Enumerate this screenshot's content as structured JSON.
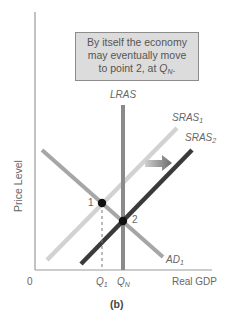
{
  "callout": {
    "line1": "By itself the economy",
    "line2": "may eventually move",
    "line3_prefix": "to point 2, at ",
    "line3_q": "Q",
    "line3_sub": "N",
    "line3_suffix": "."
  },
  "axes": {
    "y_label": "Price Level",
    "x_label": "Real GDP",
    "origin": "0"
  },
  "curves": {
    "lras": {
      "label": "LRAS",
      "color": "#8a8a8a"
    },
    "sras1": {
      "label": "SRAS",
      "sub": "1",
      "color": "#d2d2d2"
    },
    "sras2": {
      "label": "SRAS",
      "sub": "2",
      "color": "#3a3a3a"
    },
    "ad1": {
      "label": "AD",
      "sub": "1",
      "color": "#a6a6a6"
    }
  },
  "points": {
    "p1": "1",
    "p2": "2"
  },
  "ticks": {
    "q1": "Q",
    "q1_sub": "1",
    "qn": "Q",
    "qn_sub": "N"
  },
  "caption": "(b)"
}
